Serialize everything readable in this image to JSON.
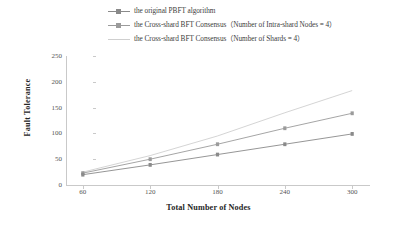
{
  "chart_data": {
    "type": "line",
    "title": "",
    "xlabel": "Total Number of Nodes",
    "ylabel": "Fault  Tolerance",
    "x": [
      60,
      120,
      180,
      240,
      300
    ],
    "xticks": [
      "60",
      "120",
      "180",
      "240",
      "300"
    ],
    "yticks": [
      "0",
      "50",
      "100",
      "150",
      "200",
      "250"
    ],
    "xlim": [
      45,
      315
    ],
    "ylim": [
      0,
      250
    ],
    "grid": false,
    "legend_position": "top-center",
    "series": [
      {
        "name": "the original PBFT algorithm",
        "values": [
          20,
          39,
          59,
          79,
          99
        ],
        "color": "#8a8a8a",
        "marker": "dash",
        "has_marker": true
      },
      {
        "name": "the Cross-shard BFT Consensus（Number of Intra-shard Nodes = 4）",
        "values": [
          23,
          50,
          79,
          110,
          139
        ],
        "color": "#9b9b9b",
        "marker": "dash",
        "has_marker": true
      },
      {
        "name": "the Cross-shard BFT Consensus（Number of Shards = 4）",
        "values": [
          25,
          57,
          95,
          140,
          183
        ],
        "color": "#cfcfcf",
        "marker": "none",
        "has_marker": false
      }
    ]
  },
  "legend": {
    "items": [
      {
        "label": "the original PBFT algorithm"
      },
      {
        "label": "the Cross-shard BFT Consensus（Number of Intra-shard Nodes = 4）"
      },
      {
        "label": "the Cross-shard BFT Consensus（Number of Shards = 4）"
      }
    ]
  }
}
